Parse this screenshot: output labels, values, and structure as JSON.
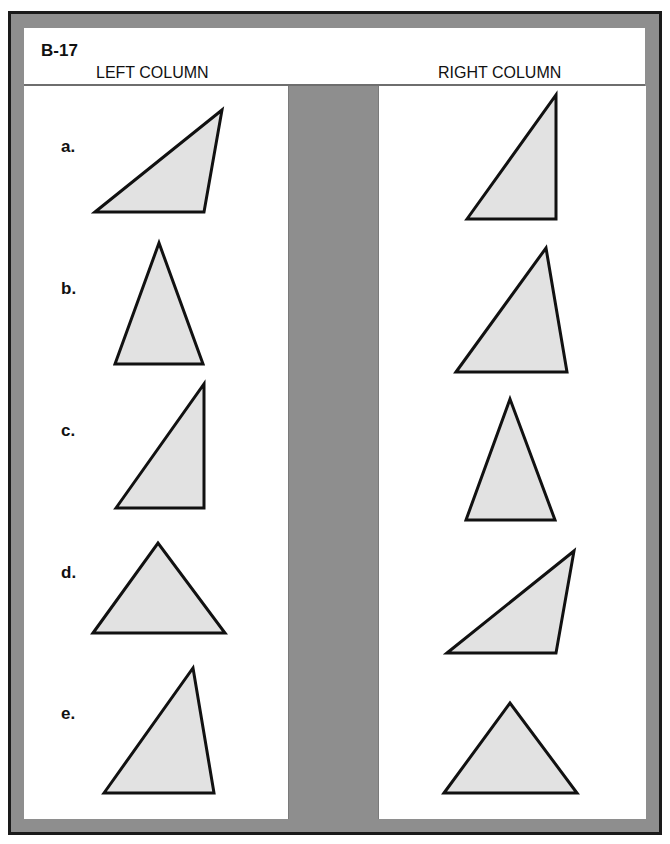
{
  "sheet": {
    "code": "B-17",
    "left_column_title": "LEFT COLUMN",
    "right_column_title": "RIGHT COLUMN"
  },
  "colors": {
    "frame_gray": "#8e8e8e",
    "border_dark": "#1a1a1a",
    "triangle_fill": "#e2e2e2",
    "triangle_stroke": "#111111"
  },
  "rows": [
    {
      "label": "a.",
      "left_shape": "obtuse triangle, apex upper-right",
      "right_shape": "right triangle, right angle lower-right"
    },
    {
      "label": "b.",
      "left_shape": "acute isosceles triangle, tall",
      "right_shape": "acute scalene triangle, apex upper-right"
    },
    {
      "label": "c.",
      "left_shape": "right triangle, right angle lower-right",
      "right_shape": "acute isosceles triangle, tall"
    },
    {
      "label": "d.",
      "left_shape": "acute triangle, wide",
      "right_shape": "obtuse triangle, apex upper-right"
    },
    {
      "label": "e.",
      "left_shape": "acute scalene triangle, apex upper-right",
      "right_shape": "acute triangle, wide"
    }
  ]
}
